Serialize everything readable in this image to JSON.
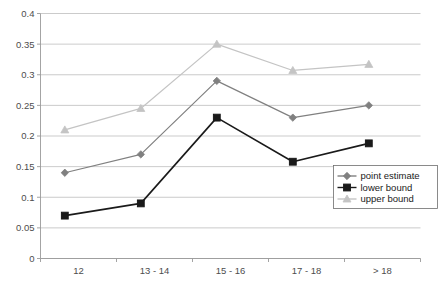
{
  "chart_data": {
    "type": "line",
    "title": "",
    "xlabel": "",
    "ylabel": "",
    "categories": [
      "12",
      "13 - 14",
      "15 - 16",
      "17 - 18",
      "> 18"
    ],
    "series": [
      {
        "name": "point estimate",
        "values": [
          0.14,
          0.17,
          0.29,
          0.23,
          0.25
        ],
        "color": "#808080",
        "marker": "diamond"
      },
      {
        "name": "lower bound",
        "values": [
          0.07,
          0.09,
          0.23,
          0.158,
          0.188
        ],
        "color": "#1a1a1a",
        "marker": "square"
      },
      {
        "name": "upper bound",
        "values": [
          0.21,
          0.245,
          0.35,
          0.307,
          0.317
        ],
        "color": "#c4c4c4",
        "marker": "triangle"
      }
    ],
    "ylim": [
      0,
      0.4
    ],
    "ytick_labels": [
      "0",
      "0.05",
      "0.1",
      "0.15",
      "0.2",
      "0.25",
      "0.3",
      "0.35",
      "0.4"
    ],
    "ytick_values": [
      0,
      0.05,
      0.1,
      0.15,
      0.2,
      0.25,
      0.3,
      0.35,
      0.4
    ],
    "grid": true,
    "legend_position": "right-bottom"
  },
  "legend": {
    "entries": [
      {
        "label": "point estimate"
      },
      {
        "label": "lower bound"
      },
      {
        "label": "upper bound"
      }
    ]
  }
}
